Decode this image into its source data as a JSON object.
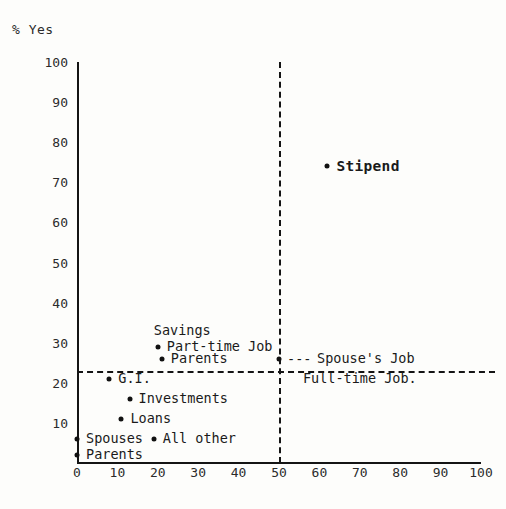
{
  "chart_data": {
    "type": "scatter",
    "title": "",
    "ylabel": "% Yes",
    "xlabel": "",
    "xlim": [
      0,
      100
    ],
    "ylim": [
      0,
      100
    ],
    "xticks": [
      "0",
      "10",
      "20",
      "30",
      "40",
      "50",
      "60",
      "70",
      "80",
      "90",
      "100"
    ],
    "yticks": [
      "10",
      "20",
      "30",
      "40",
      "50",
      "60",
      "70",
      "80",
      "90",
      "100"
    ],
    "grid": false,
    "legend": "none",
    "reference_lines": [
      {
        "name": "vertical-50",
        "orientation": "vertical",
        "value": 50,
        "style": "dashed"
      },
      {
        "name": "horizontal-23",
        "orientation": "horizontal",
        "value": 23,
        "style": "dashed"
      }
    ],
    "points": [
      {
        "label": "Savings",
        "x": 19,
        "y": 33,
        "label_pos": "above",
        "bold": false,
        "dot": false
      },
      {
        "label": "Part-time Job",
        "x": 20,
        "y": 29,
        "label_pos": "right",
        "bold": false,
        "dot": true
      },
      {
        "label": "Parents",
        "x": 21,
        "y": 26,
        "label_pos": "right",
        "bold": false,
        "dot": true
      },
      {
        "label": "Spouse's Job",
        "x": 50,
        "y": 26,
        "label_pos": "leader",
        "bold": false,
        "dot": true
      },
      {
        "label": "G.I.",
        "x": 8,
        "y": 21,
        "label_pos": "right",
        "bold": false,
        "dot": true
      },
      {
        "label": "Full-time Job.",
        "x": 70,
        "y": 21,
        "label_pos": "center",
        "bold": false,
        "dot": false
      },
      {
        "label": "Investments",
        "x": 13,
        "y": 16,
        "label_pos": "right",
        "bold": false,
        "dot": true
      },
      {
        "label": "Loans",
        "x": 11,
        "y": 11,
        "label_pos": "right",
        "bold": false,
        "dot": true
      },
      {
        "label": "Spouses",
        "x": 0,
        "y": 6,
        "label_pos": "right",
        "bold": false,
        "dot": true
      },
      {
        "label": "All other",
        "x": 19,
        "y": 6,
        "label_pos": "right",
        "bold": false,
        "dot": true
      },
      {
        "label": "Parents",
        "x": 0,
        "y": 2,
        "label_pos": "right",
        "bold": false,
        "dot": true
      },
      {
        "label": "Stipend",
        "x": 62,
        "y": 74,
        "label_pos": "right",
        "bold": true,
        "dot": true
      }
    ],
    "leader_text": "---"
  },
  "colors": {
    "ink": "#1a1a1a",
    "paper": "#fdfdfb",
    "axis": "#141414"
  }
}
